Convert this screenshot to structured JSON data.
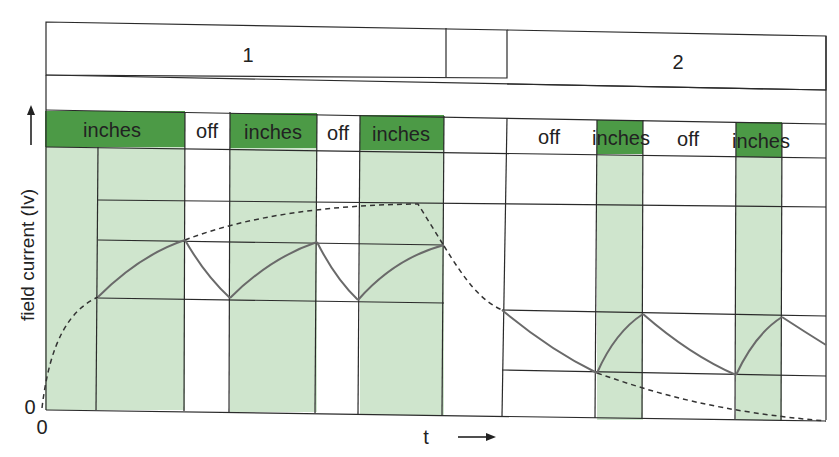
{
  "diagram": {
    "section_labels": [
      "1",
      "2"
    ],
    "phase_labels_section1": [
      "inches",
      "off",
      "inches",
      "off",
      "inches"
    ],
    "phase_labels_section2": [
      "off",
      "inches",
      "off",
      "inches"
    ],
    "y_axis_label": "field current (Iv)",
    "x_axis_label": "t",
    "y_origin_label": "0",
    "x_origin_label": "0",
    "colors": {
      "on_bar": "#4c9a46",
      "on_shade": "#cfe5cd",
      "grid": "#2a2a2a",
      "curve": "#6a6a6a"
    }
  }
}
